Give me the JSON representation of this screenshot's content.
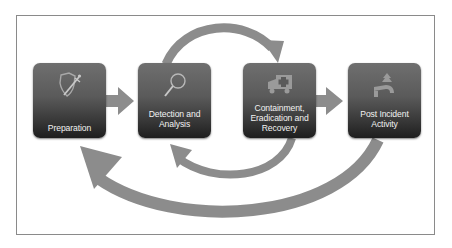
{
  "diagram": {
    "type": "cycle",
    "arrow_color": "#8c8c8c",
    "box_color": "#4a4a4a",
    "label_color": "#f2f2f2",
    "phases": [
      {
        "id": "preparation",
        "label": "Preparation",
        "icon": "shield-sword-icon"
      },
      {
        "id": "detection",
        "label": "Detection and Analysis",
        "icon": "magnifier-icon"
      },
      {
        "id": "containment",
        "label": "Containment, Eradication and Recovery",
        "icon": "ambulance-icon"
      },
      {
        "id": "post_incident",
        "label": "Post Incident Activity",
        "icon": "road-tree-icon"
      }
    ],
    "arrows": [
      {
        "from": "Preparation",
        "to": "Detection and Analysis",
        "style": "straight"
      },
      {
        "from": "Containment, Eradication and Recovery",
        "to": "Post Incident Activity",
        "style": "straight"
      },
      {
        "from": "Detection and Analysis",
        "to": "Containment, Eradication and Recovery",
        "style": "arc-top"
      },
      {
        "from": "Containment, Eradication and Recovery",
        "to": "Detection and Analysis",
        "style": "arc-bottom"
      },
      {
        "from": "Post Incident Activity",
        "to": "Preparation",
        "style": "arc-bottom-large"
      }
    ]
  }
}
